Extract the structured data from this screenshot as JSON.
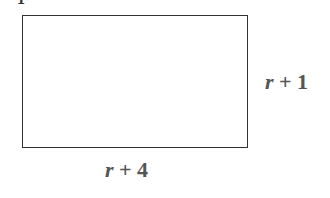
{
  "diagram": {
    "shape": "rectangle",
    "top_cut_glyph": "1",
    "side_label": {
      "var": "r",
      "rest": " + 1"
    },
    "bottom_label": {
      "var": "r",
      "rest": " + 4"
    },
    "stroke_color": "#333333",
    "label_color": "#555555"
  }
}
